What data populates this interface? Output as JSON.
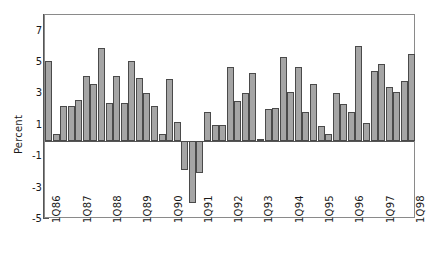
{
  "chart_data": {
    "type": "bar",
    "title": "",
    "subtitle": "",
    "xlabel": "",
    "ylabel": "Percent",
    "ylim": [
      -5,
      8
    ],
    "yticks": [
      7,
      5,
      3,
      1,
      -1,
      -3,
      -5
    ],
    "ytick_labels": [
      "7",
      "5",
      "3",
      "1",
      "-1",
      "-3",
      "-5"
    ],
    "grid": false,
    "legend": null,
    "bar_color": "#a5a5a5",
    "bar_edge_color": "#4a4a4a",
    "axis_color": "#555555",
    "categories": [
      "1Q86",
      "2Q86",
      "3Q86",
      "4Q86",
      "1Q87",
      "2Q87",
      "3Q87",
      "4Q87",
      "1Q88",
      "2Q88",
      "3Q88",
      "4Q88",
      "1Q89",
      "2Q89",
      "3Q89",
      "4Q89",
      "1Q90",
      "2Q90",
      "3Q90",
      "4Q90",
      "1Q91",
      "2Q91",
      "3Q91",
      "4Q91",
      "1Q92",
      "2Q92",
      "3Q92",
      "4Q92",
      "1Q93",
      "2Q93",
      "3Q93",
      "4Q93",
      "1Q94",
      "2Q94",
      "3Q94",
      "4Q94",
      "1Q95",
      "2Q95",
      "3Q95",
      "4Q95",
      "1Q96",
      "2Q96",
      "3Q96",
      "4Q96",
      "1Q97",
      "2Q97",
      "3Q97",
      "4Q97",
      "1Q98"
    ],
    "values": [
      5.1,
      0.4,
      2.2,
      2.2,
      2.6,
      4.1,
      3.6,
      5.9,
      2.4,
      4.1,
      2.4,
      5.1,
      4.0,
      3.0,
      2.2,
      0.4,
      3.9,
      1.2,
      -1.9,
      -4.0,
      -2.1,
      1.8,
      1.0,
      1.0,
      4.7,
      2.5,
      3.0,
      4.3,
      0.1,
      2.0,
      2.1,
      5.3,
      3.1,
      4.7,
      1.8,
      3.6,
      0.9,
      0.4,
      3.0,
      2.3,
      1.8,
      6.0,
      1.1,
      4.4,
      4.9,
      3.4,
      3.1,
      3.8,
      5.5
    ],
    "xtick_labels": [
      "1Q86",
      "1Q87",
      "1Q88",
      "1Q89",
      "1Q90",
      "1Q91",
      "1Q92",
      "1Q93",
      "1Q94",
      "1Q95",
      "1Q96",
      "1Q97",
      "1Q98"
    ],
    "xtick_indices": [
      0,
      4,
      8,
      12,
      16,
      20,
      24,
      28,
      32,
      36,
      40,
      44,
      48
    ]
  }
}
